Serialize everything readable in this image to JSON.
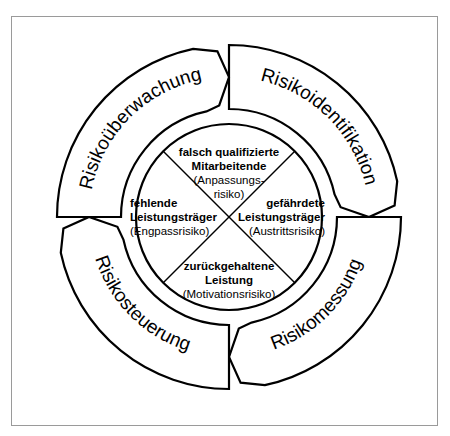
{
  "diagram": {
    "type": "cycle",
    "ring_segments": [
      {
        "id": "identification",
        "label": "Risikoidentifikation"
      },
      {
        "id": "measurement",
        "label": "Risikomessung"
      },
      {
        "id": "control",
        "label": "Risikosteuerung"
      },
      {
        "id": "monitoring",
        "label": "Risikoüberwachung"
      }
    ],
    "quadrants": {
      "top": {
        "bold_lines": [
          "falsch qualifizierte",
          "Mitarbeitende"
        ],
        "normal_lines": [
          "(Anpassungs-",
          "risiko)"
        ]
      },
      "right": {
        "bold_lines": [
          "gefährdete",
          "Leistungsträger"
        ],
        "normal_lines": [
          "(Austrittsrisiko)"
        ]
      },
      "bottom": {
        "bold_lines": [
          "zurückgehaltene",
          "Leistung"
        ],
        "normal_lines": [
          "(Motivationsrisiko)"
        ]
      },
      "left": {
        "bold_lines": [
          "fehlende",
          "Leistungsträger"
        ],
        "normal_lines": [
          "(Engpassrisiko)"
        ]
      }
    },
    "colors": {
      "stroke": "#000000",
      "fill": "#ffffff",
      "frame": "#9a9a9a"
    }
  }
}
